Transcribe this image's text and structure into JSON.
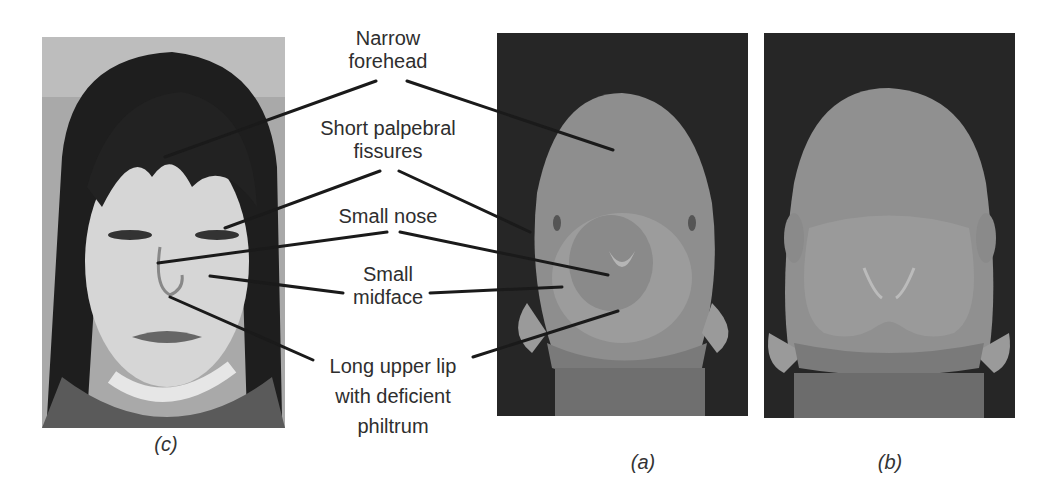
{
  "figure": {
    "panels": [
      {
        "id": "c",
        "caption": "(c)",
        "description": "Photograph of a child's face showing facial features"
      },
      {
        "id": "a",
        "caption": "(a)",
        "description": "Scanning electron micrograph of an embryonic face (affected)"
      },
      {
        "id": "b",
        "caption": "(b)",
        "description": "Scanning electron micrograph of an embryonic face (control)"
      }
    ],
    "labels": [
      {
        "line1": "Narrow",
        "line2": "forehead"
      },
      {
        "line1": "Short palpebral",
        "line2": "fissures"
      },
      {
        "line1": "Small nose"
      },
      {
        "line1": "Small",
        "line2": "midface"
      },
      {
        "line1": "Long upper lip",
        "line2": "with deficient",
        "line3": "philtrum"
      }
    ]
  },
  "colors": {
    "background": "#ffffff",
    "text": "#2e2e2e",
    "leader_line": "#1a1a1a",
    "sem_background": "#2a2a2a",
    "sem_tissue": "#8a8a8a"
  }
}
